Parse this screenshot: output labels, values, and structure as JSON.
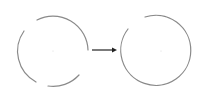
{
  "diagram": {
    "colors": {
      "stroke": "#8a8a8a",
      "arrow": "#222222",
      "center_dot": "#d8d8d8",
      "background": "#ffffff"
    },
    "left_circle": {
      "cx": 53,
      "cy": 51,
      "r": 35,
      "segments": 3
    },
    "arrow": {
      "x1": 92,
      "y1": 50,
      "x2": 116,
      "y2": 50
    },
    "right_circle": {
      "cx": 161,
      "cy": 51,
      "r": 35,
      "segments": 1
    }
  }
}
